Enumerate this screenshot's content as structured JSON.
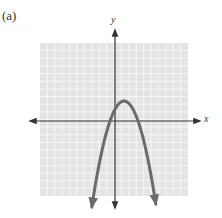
{
  "figure": {
    "panel_label": "(a)",
    "x_axis_label": "x",
    "y_axis_label": "y",
    "colors": {
      "grid_background": "#e4e4e4",
      "grid_lines": "#f6f6f6",
      "axis": "#333333",
      "curve": "#6b6b6b"
    },
    "grid": {
      "cells_x": 20,
      "cells_y": 20,
      "pixel_bounds": {
        "left": 40,
        "top": 43,
        "right": 188,
        "bottom": 196
      }
    },
    "axes_pixels": {
      "origin_x": 115,
      "origin_y": 121
    },
    "curve": {
      "type": "downward parabola",
      "vertex_units": [
        1.2,
        2.7
      ],
      "approx_roots_units": [
        -0.7,
        3.2
      ],
      "arrows_at_ends": true
    }
  }
}
